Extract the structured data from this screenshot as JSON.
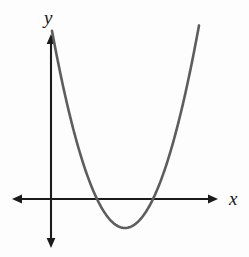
{
  "figure": {
    "kind": "cartesian-graph",
    "width": 249,
    "height": 257,
    "background_color": "#fdfdfd",
    "axis_color": "#1b1b1b",
    "curve_color": "#5d5d5d"
  },
  "labels": {
    "x_axis": "x",
    "y_axis": "y"
  },
  "chart_data": {
    "type": "line",
    "title": "",
    "subtitle": "",
    "xlabel": "x",
    "ylabel": "y",
    "grid": false,
    "legend": null,
    "annotations": [],
    "curves": [
      {
        "name": "parabola",
        "shape": "upward-opening parabola",
        "equation": "y = a(x - h)^2 + k",
        "color": "#5d5d5d",
        "vertex": {
          "x": 74,
          "y": -29
        },
        "roots": [
          46,
          101
        ],
        "opens": "up",
        "leading_coefficient": 0.0398,
        "x": [
          46,
          52,
          58,
          64,
          70,
          74,
          80,
          86,
          92,
          97,
          101,
          107,
          113,
          119,
          125,
          131,
          137,
          143,
          148
        ],
        "y": [
          -29.0,
          -8.4,
          9.8,
          25.6,
          29.0,
          -29.0,
          -18.0,
          0.0,
          12.0,
          22.0,
          0.0,
          -9.0,
          -14.0,
          -10.0,
          0.0,
          18.0,
          44.0,
          78.0,
          110.0
        ],
        "pixel_vertex": {
          "x": 125,
          "y": 228
        },
        "pixel_roots": [
          97,
          152
        ],
        "pixel_left_end": {
          "x": 52,
          "y": 42
        },
        "pixel_right_end": {
          "x": 199,
          "y": 30
        }
      }
    ],
    "axes": {
      "origin_pixel": {
        "x": 51,
        "y": 199
      },
      "x_axis_pixel_span": [
        12,
        218
      ],
      "y_axis_pixel_span": [
        34,
        248
      ],
      "xlim": [
        -39,
        167
      ],
      "ylim": [
        -49,
        165
      ],
      "arrowheads": [
        "x-left",
        "x-right",
        "y-up",
        "y-down"
      ],
      "ticks": [],
      "tick_labels": []
    }
  }
}
